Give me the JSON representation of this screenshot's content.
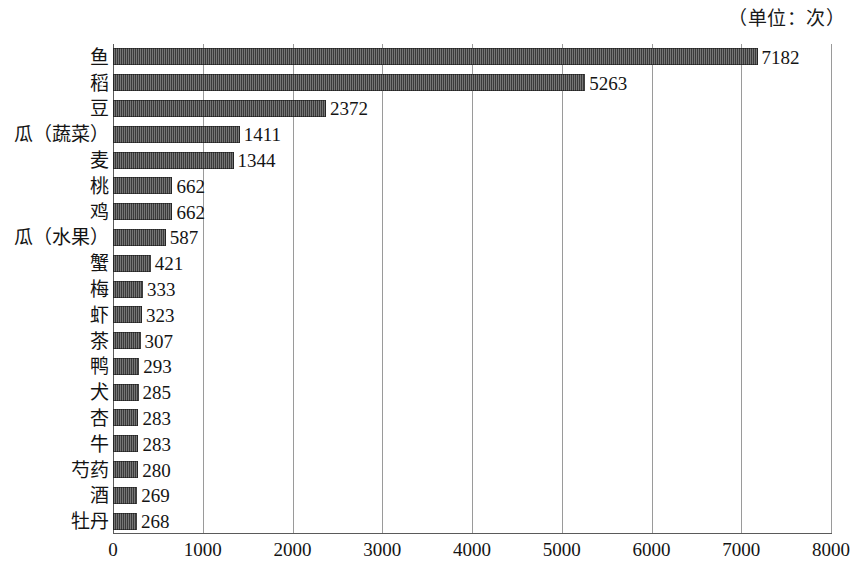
{
  "chart_data": {
    "type": "bar",
    "orientation": "horizontal",
    "title": "",
    "unit_caption": "（单位：次）",
    "xlabel": "",
    "ylabel": "",
    "xlim": [
      0,
      8000
    ],
    "xticks": [
      0,
      1000,
      2000,
      3000,
      4000,
      5000,
      6000,
      7000,
      8000
    ],
    "xtick_labels": [
      "0",
      "1000",
      "2000",
      "3000",
      "4000",
      "5000",
      "6000",
      "7000",
      "8000"
    ],
    "grid": "vertical",
    "legend": null,
    "bar_color": "#3b3b3b",
    "gridline_color": "#9a9a9a",
    "axis_color": "#5a5a5a",
    "categories": [
      "鱼",
      "稻",
      "豆",
      "瓜（蔬菜）",
      "麦",
      "桃",
      "鸡",
      "瓜（水果）",
      "蟹",
      "梅",
      "虾",
      "茶",
      "鸭",
      "犬",
      "杏",
      "牛",
      "芍药",
      "酒",
      "牡丹"
    ],
    "values": [
      7182,
      5263,
      2372,
      1411,
      1344,
      662,
      662,
      587,
      421,
      333,
      323,
      307,
      293,
      285,
      283,
      283,
      280,
      269,
      268
    ],
    "value_labels": [
      "7182",
      "5263",
      "2372",
      "1411",
      "1344",
      "662",
      "662",
      "587",
      "421",
      "333",
      "323",
      "307",
      "293",
      "285",
      "283",
      "283",
      "280",
      "269",
      "268"
    ]
  }
}
